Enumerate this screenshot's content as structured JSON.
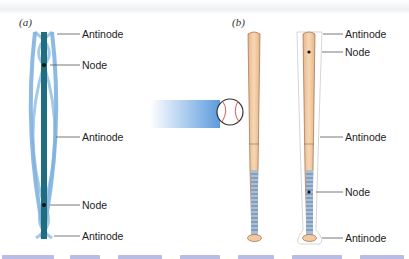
{
  "figure": {
    "panel_a": {
      "label": "(a)",
      "annotations": [
        {
          "text": "Antinode",
          "y": 34
        },
        {
          "text": "Node",
          "y": 65
        },
        {
          "text": "Antinode",
          "y": 137
        },
        {
          "text": "Node",
          "y": 205
        },
        {
          "text": "Antinode",
          "y": 236
        }
      ]
    },
    "panel_b": {
      "label": "(b)",
      "annotations": [
        {
          "text": "Antinode",
          "y": 34
        },
        {
          "text": "Node",
          "y": 52
        },
        {
          "text": "Antinode",
          "y": 137
        },
        {
          "text": "Node",
          "y": 192
        },
        {
          "text": "Antinode",
          "y": 238
        }
      ]
    },
    "colors": {
      "rod_dark": "#1f6e7f",
      "rod_light": "#7fb2df",
      "bat_wood": "#f2c9a1",
      "bat_grip": "#a9bfd8",
      "motion_blur": "#4a90d9",
      "caption": "#3b46c4"
    }
  }
}
